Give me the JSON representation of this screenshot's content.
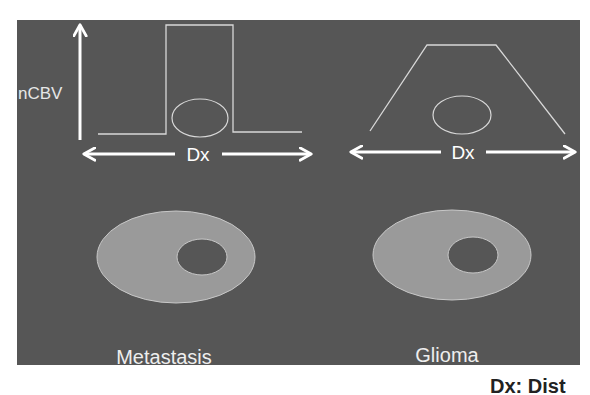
{
  "figure": {
    "panel_color": "#565656",
    "line_color": "#d8d8d8",
    "arrow_color": "#ffffff",
    "ring_fill": "#9a9a9a",
    "ring_stroke": "#c8c8c8",
    "y_axis_label": "nCBV",
    "left": {
      "label": "Metastasis",
      "axis_label": "Dx",
      "profile_shape": "rectangular-peak"
    },
    "right": {
      "label": "Glioma",
      "axis_label": "Dx",
      "profile_shape": "trapezoid"
    }
  },
  "caption": {
    "visible_fragment": "Dx: Dist"
  }
}
